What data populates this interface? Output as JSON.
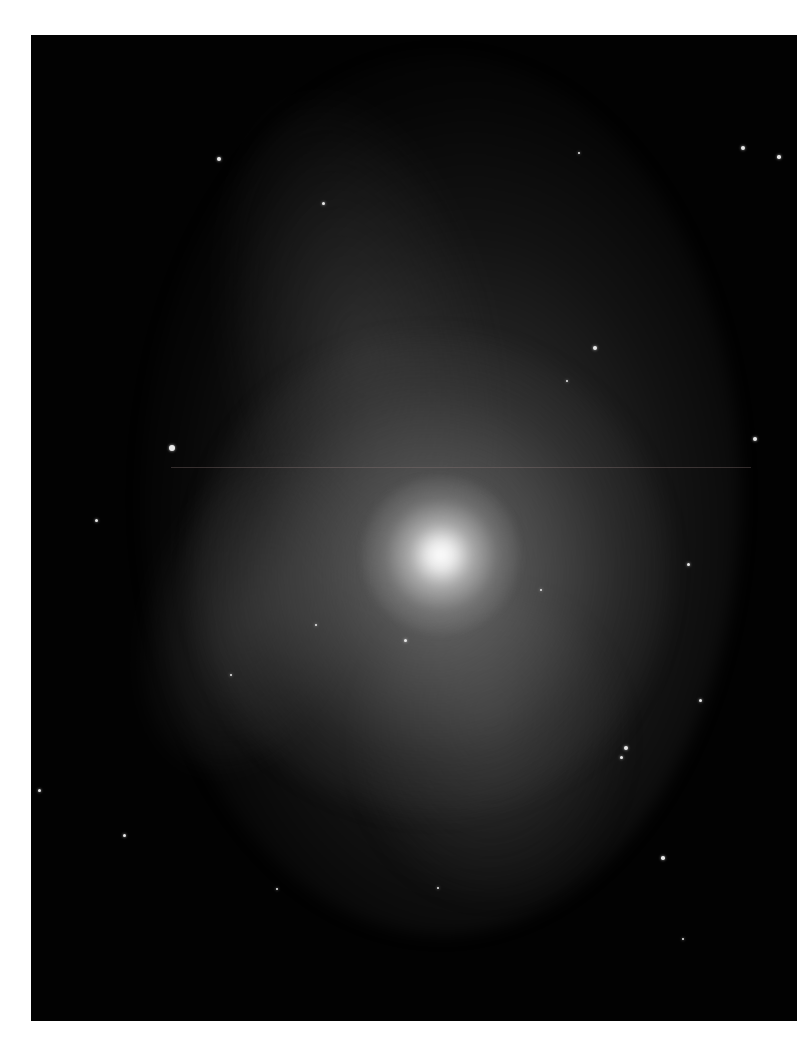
{
  "image": {
    "subject": "spiral galaxy",
    "background_color": "#ffffff",
    "frame_color": "#020202",
    "core_color": "#ffffff",
    "stars": [
      {
        "x": 188,
        "y": 124,
        "r": 2
      },
      {
        "x": 292,
        "y": 168,
        "r": 1.5
      },
      {
        "x": 548,
        "y": 118,
        "r": 1.2
      },
      {
        "x": 712,
        "y": 113,
        "r": 2.2
      },
      {
        "x": 748,
        "y": 122,
        "r": 1.8
      },
      {
        "x": 564,
        "y": 313,
        "r": 2.2
      },
      {
        "x": 536,
        "y": 346,
        "r": 1.2
      },
      {
        "x": 141,
        "y": 413,
        "r": 3
      },
      {
        "x": 724,
        "y": 404,
        "r": 2
      },
      {
        "x": 65,
        "y": 485,
        "r": 1.5
      },
      {
        "x": 657,
        "y": 529,
        "r": 1.5
      },
      {
        "x": 374,
        "y": 605,
        "r": 1.5
      },
      {
        "x": 669,
        "y": 665,
        "r": 1.5
      },
      {
        "x": 595,
        "y": 713,
        "r": 2
      },
      {
        "x": 590,
        "y": 722,
        "r": 1.5
      },
      {
        "x": 8,
        "y": 755,
        "r": 1.5
      },
      {
        "x": 93,
        "y": 800,
        "r": 1.5
      },
      {
        "x": 632,
        "y": 823,
        "r": 1.8
      },
      {
        "x": 246,
        "y": 854,
        "r": 1.2
      },
      {
        "x": 407,
        "y": 853,
        "r": 1.2
      },
      {
        "x": 652,
        "y": 904,
        "r": 1.2
      },
      {
        "x": 285,
        "y": 590,
        "r": 1.2
      },
      {
        "x": 510,
        "y": 555,
        "r": 1.2
      },
      {
        "x": 200,
        "y": 640,
        "r": 1
      }
    ]
  }
}
